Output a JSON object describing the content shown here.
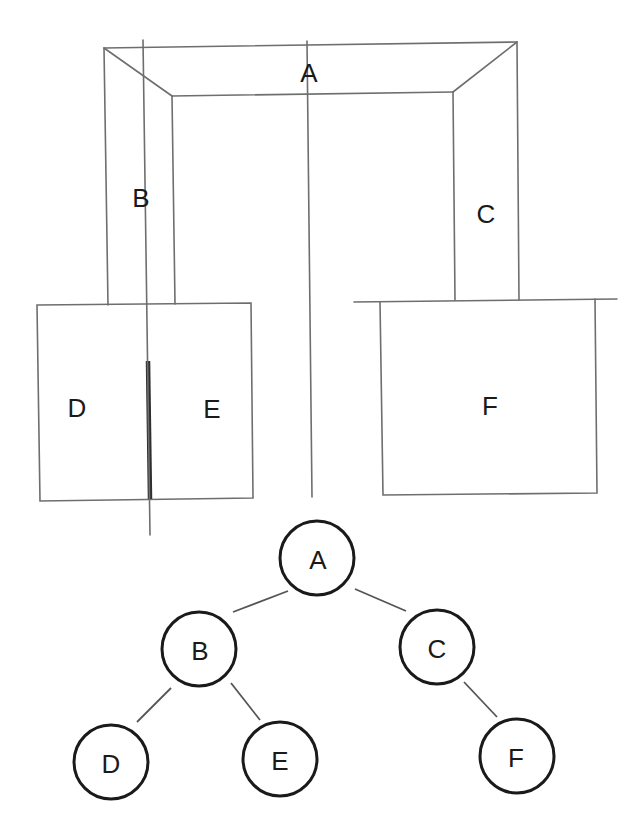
{
  "diagram": {
    "title": "",
    "region_labels": {
      "A": "A",
      "B": "B",
      "C": "C",
      "D": "D",
      "E": "E",
      "F": "F"
    },
    "tree": {
      "nodes": [
        {
          "id": "A",
          "label": "A"
        },
        {
          "id": "B",
          "label": "B"
        },
        {
          "id": "C",
          "label": "C"
        },
        {
          "id": "D",
          "label": "D"
        },
        {
          "id": "E",
          "label": "E"
        },
        {
          "id": "F",
          "label": "F"
        }
      ],
      "edges": [
        {
          "from": "A",
          "to": "B"
        },
        {
          "from": "A",
          "to": "C"
        },
        {
          "from": "B",
          "to": "D"
        },
        {
          "from": "B",
          "to": "E"
        },
        {
          "from": "C",
          "to": "F"
        }
      ]
    }
  }
}
